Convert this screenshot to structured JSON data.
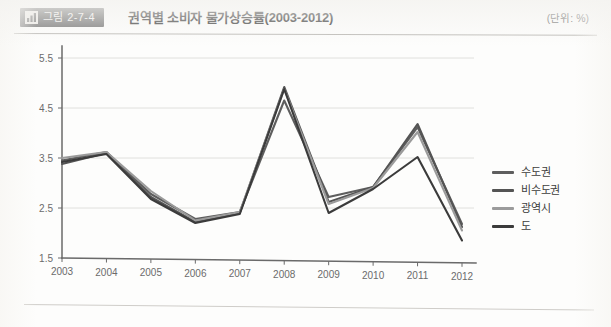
{
  "header": {
    "badge_icon": "bar-chart-icon",
    "badge_label": "그림 2-7-4",
    "title": "권역별 소비자 물가상승률(2003-2012)",
    "unit_note": "(단위: %)"
  },
  "chart_data": {
    "type": "line",
    "title": "권역별 소비자 물가상승률(2003-2012)",
    "xlabel": "",
    "ylabel": "",
    "unit": "%",
    "categories": [
      "2003",
      "2004",
      "2005",
      "2006",
      "2007",
      "2008",
      "2009",
      "2010",
      "2011",
      "2012"
    ],
    "ylim": [
      1.5,
      5.5
    ],
    "yticks": [
      "1.5",
      "2.5",
      "3.5",
      "4.5",
      "5.5"
    ],
    "ytick_values": [
      1.5,
      2.5,
      3.5,
      4.5,
      5.5
    ],
    "grid": true,
    "legend_position": "right",
    "series": [
      {
        "name": "수도권",
        "color": "#5e5e5e",
        "values": [
          3.45,
          3.62,
          2.78,
          2.28,
          2.42,
          4.65,
          2.72,
          2.92,
          4.12,
          2.18
        ]
      },
      {
        "name": "비수도권",
        "color": "#545454",
        "values": [
          3.38,
          3.6,
          2.72,
          2.22,
          2.4,
          4.92,
          2.62,
          2.92,
          4.18,
          2.12
        ]
      },
      {
        "name": "광역시",
        "color": "#9b9b9b",
        "values": [
          3.5,
          3.62,
          2.84,
          2.25,
          2.42,
          4.88,
          2.58,
          2.9,
          4.02,
          2.05
        ]
      },
      {
        "name": "도",
        "color": "#3b3b3b",
        "values": [
          3.42,
          3.58,
          2.68,
          2.2,
          2.38,
          4.88,
          2.4,
          2.88,
          3.52,
          1.85
        ]
      }
    ]
  },
  "legend": {
    "items": [
      {
        "label": "수도권",
        "color": "#5e5e5e"
      },
      {
        "label": "비수도권",
        "color": "#545454"
      },
      {
        "label": "광역시",
        "color": "#9b9b9b"
      },
      {
        "label": "도",
        "color": "#3b3b3b"
      }
    ]
  }
}
